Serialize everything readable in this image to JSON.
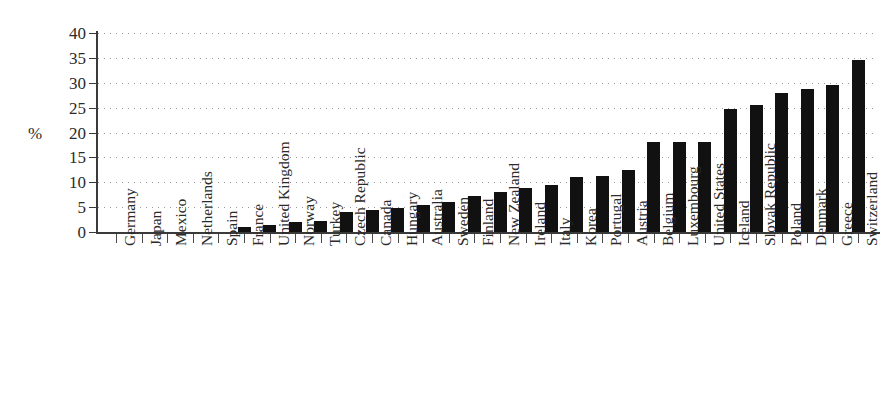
{
  "chart_data": {
    "type": "bar",
    "title": "",
    "subtitle": "",
    "xlabel": "",
    "ylabel": "%",
    "ylim": [
      0,
      40
    ],
    "yticks": [
      0,
      5,
      10,
      15,
      20,
      25,
      30,
      35,
      40
    ],
    "grid": "horizontal-dotted",
    "legend": "none",
    "bar_color": "#111111",
    "categories": [
      "Germany",
      "Japan",
      "Mexico",
      "Netherlands",
      "Spain",
      "France",
      "United Kingdom",
      "Norway",
      "Turkey",
      "Czech Republic",
      "Canada",
      "Hungary",
      "Australia",
      "Sweden",
      "Finland",
      "New Zealand",
      "Ireland",
      "Italy",
      "Korea",
      "Portugal",
      "Austria",
      "Belgium",
      "Luxembourg",
      "United States",
      "Iceland",
      "Slovak Republic",
      "Poland",
      "Denmark",
      "Greece",
      "Switzerland"
    ],
    "values": [
      0,
      0,
      0,
      0,
      0,
      1.1,
      1.5,
      2.1,
      2.2,
      4.0,
      4.4,
      4.8,
      5.5,
      6.1,
      7.3,
      8.0,
      8.8,
      9.4,
      11.0,
      11.3,
      12.5,
      18.1,
      18.1,
      18.1,
      24.8,
      25.6,
      28.0,
      28.8,
      29.5,
      34.5
    ]
  },
  "axis": {
    "unit_label": "%"
  }
}
